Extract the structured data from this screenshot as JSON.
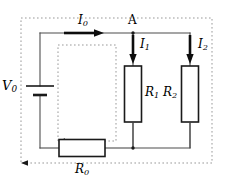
{
  "figure": {
    "type": "circuit-diagram",
    "background_color": "#ffffff",
    "wire_color": "#4d4d4d",
    "component_color": "#1a1a1a",
    "dashed_loop_color": "#999999",
    "arrow_color": "#000000",
    "width": 227,
    "height": 184
  },
  "labels": {
    "source_voltage": {
      "text": "V",
      "sub": "0",
      "x": 3,
      "y": 83
    },
    "total_current": {
      "text": "I",
      "sub": "0",
      "x": 74,
      "y": 17
    },
    "node_a": {
      "text": "A",
      "sub": "",
      "x": 127,
      "y": 13
    },
    "branch_current_1": {
      "text": "I",
      "sub": "1",
      "x": 141,
      "y": 39
    },
    "branch_current_2": {
      "text": "I",
      "sub": "2",
      "x": 199,
      "y": 39
    },
    "resistor_1": {
      "text": "R",
      "sub": "1",
      "x": 141,
      "y": 84
    },
    "resistor_2": {
      "text": "R",
      "sub": "2",
      "x": 169,
      "y": 84
    },
    "resistor_0": {
      "text": "R",
      "sub": "0",
      "x": 74,
      "y": 167
    }
  },
  "components": [
    {
      "name": "battery",
      "kind": "cell",
      "x": 40,
      "y": 90,
      "label_ref": "source_voltage"
    },
    {
      "name": "resistor-r1",
      "kind": "resistor",
      "x": 133,
      "y": 94,
      "w": 17,
      "h": 56,
      "label_ref": "resistor_1"
    },
    {
      "name": "resistor-r2",
      "kind": "resistor",
      "x": 190,
      "y": 94,
      "w": 17,
      "h": 56,
      "label_ref": "resistor_2"
    },
    {
      "name": "resistor-r0",
      "kind": "resistor",
      "x": 82,
      "y": 148,
      "w": 46,
      "h": 17,
      "label_ref": "resistor_0"
    }
  ],
  "nodes": [
    {
      "name": "node-a",
      "x": 133,
      "y": 33,
      "filled": true
    },
    {
      "name": "node-bottom-junction",
      "x": 133,
      "y": 148,
      "filled": true
    }
  ],
  "current_arrows": [
    {
      "name": "arrow-i0",
      "direction": "right",
      "x1": 63,
      "y1": 33,
      "x2": 99,
      "y2": 33,
      "label_ref": "total_current"
    },
    {
      "name": "arrow-i1",
      "direction": "down",
      "x1": 133,
      "y1": 33,
      "x2": 133,
      "y2": 60,
      "label_ref": "branch_current_1"
    },
    {
      "name": "arrow-i2",
      "direction": "down",
      "x1": 190,
      "y1": 33,
      "x2": 190,
      "y2": 60,
      "label_ref": "branch_current_2"
    }
  ],
  "dashed_loops": [
    {
      "name": "outer-loop",
      "x": 21,
      "y": 18,
      "w": 191,
      "h": 145,
      "arrow_at": "bottom-left",
      "arrow_dir": "left"
    },
    {
      "name": "inner-loop",
      "x": 58,
      "y": 45,
      "w": 58,
      "h": 96,
      "arrow_at": "bottom-left",
      "arrow_dir": "left"
    }
  ],
  "wires": {
    "top_y": 33,
    "bottom_y": 148,
    "left_x": 40,
    "r1_x": 133,
    "r2_x": 190
  }
}
